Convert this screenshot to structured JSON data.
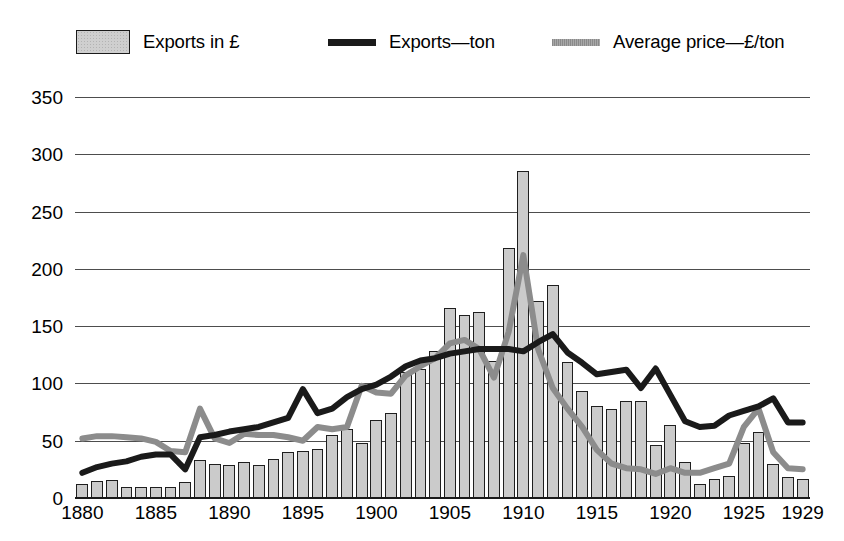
{
  "legend": {
    "entries": [
      {
        "key": "exports_value",
        "label": "Exports in £",
        "marker": "filled-box"
      },
      {
        "key": "exports_ton",
        "label": "Exports—ton",
        "marker": "black-line"
      },
      {
        "key": "avg_price",
        "label": "Average price—£/ton",
        "marker": "gray-line"
      }
    ]
  },
  "colors": {
    "bar_fill": "#cbcbcb",
    "bar_edge": "#1f1f1f",
    "exports_ton_line": "#1a1a1a",
    "avg_price_line": "#8c8c8c",
    "gridline": "#4d4d4d",
    "axis": "#1a1a1a",
    "background": "#ffffff"
  },
  "chart_data": {
    "type": "bar",
    "title": "",
    "subtitle": "",
    "xlabel": "",
    "ylabel": "",
    "xlim": [
      1880,
      1929
    ],
    "ylim": [
      0,
      350
    ],
    "yticks": [
      0,
      50,
      100,
      150,
      200,
      250,
      300,
      350
    ],
    "ytick_labels": [
      "0",
      "50",
      "100",
      "150",
      "200",
      "250",
      "300",
      "350"
    ],
    "xticks": [
      1880,
      1885,
      1890,
      1895,
      1900,
      1905,
      1910,
      1915,
      1920,
      1925,
      1929
    ],
    "xtick_labels": [
      "1880",
      "1885",
      "1890",
      "1895",
      "1900",
      "1905",
      "1910",
      "1915",
      "1920",
      "1925",
      "1929"
    ],
    "grid": true,
    "legend_position": "top",
    "categories": [
      1880,
      1881,
      1882,
      1883,
      1884,
      1885,
      1886,
      1887,
      1888,
      1889,
      1890,
      1891,
      1892,
      1893,
      1894,
      1895,
      1896,
      1897,
      1898,
      1899,
      1900,
      1901,
      1902,
      1903,
      1904,
      1905,
      1906,
      1907,
      1908,
      1909,
      1910,
      1911,
      1912,
      1913,
      1914,
      1915,
      1916,
      1917,
      1918,
      1919,
      1920,
      1921,
      1922,
      1923,
      1924,
      1925,
      1926,
      1927,
      1928,
      1929
    ],
    "series": [
      {
        "name": "Exports in £",
        "type": "bar",
        "unit": "£ (index)",
        "values": [
          12,
          15,
          16,
          10,
          10,
          10,
          10,
          14,
          33,
          30,
          29,
          31,
          29,
          34,
          40,
          41,
          43,
          55,
          60,
          48,
          68,
          74,
          110,
          113,
          128,
          166,
          160,
          162,
          120,
          218,
          285,
          172,
          186,
          119,
          93,
          80,
          78,
          85,
          85,
          46,
          64,
          31,
          12,
          17,
          19,
          48,
          58,
          30,
          18,
          17
        ]
      },
      {
        "name": "Exports—ton",
        "type": "line",
        "unit": "tons (index)",
        "values": [
          22,
          27,
          30,
          32,
          36,
          38,
          38,
          25,
          53,
          55,
          58,
          60,
          62,
          66,
          70,
          95,
          74,
          78,
          88,
          95,
          99,
          106,
          115,
          120,
          122,
          126,
          128,
          130,
          130,
          130,
          128,
          136,
          143,
          127,
          118,
          108,
          110,
          112,
          96,
          113,
          90,
          67,
          62,
          63,
          72,
          76,
          80,
          87,
          66,
          66
        ]
      },
      {
        "name": "Average price—£/ton",
        "type": "line",
        "unit": "£/ton",
        "values": [
          52,
          54,
          54,
          53,
          52,
          49,
          41,
          40,
          78,
          52,
          48,
          56,
          55,
          55,
          53,
          50,
          62,
          60,
          62,
          98,
          92,
          91,
          107,
          115,
          122,
          135,
          138,
          130,
          105,
          145,
          212,
          130,
          96,
          78,
          62,
          42,
          30,
          26,
          25,
          21,
          26,
          22,
          22,
          26,
          30,
          62,
          78,
          40,
          26,
          25
        ]
      }
    ]
  }
}
